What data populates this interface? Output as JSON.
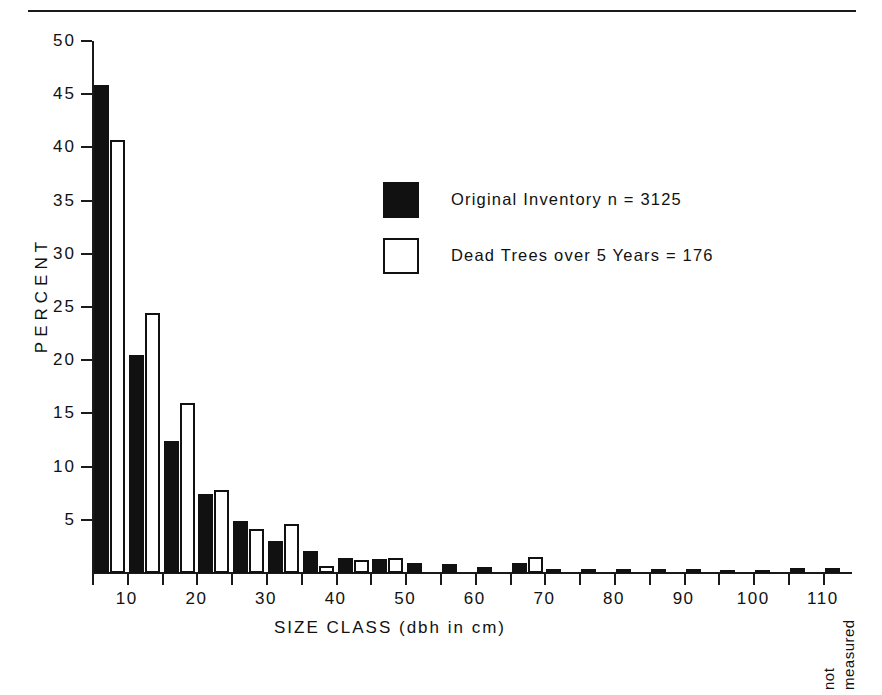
{
  "figure": {
    "top_rule": "horizontal-rule"
  },
  "axes": {
    "y_title": "PERCENT",
    "x_title": "SIZE CLASS  (dbh in cm)",
    "y_ticks": [
      "50",
      "45",
      "40",
      "35",
      "30",
      "25",
      "20",
      "15",
      "10",
      "5"
    ],
    "x_ticks": [
      "10",
      "20",
      "30",
      "40",
      "50",
      "60",
      "70",
      "80",
      "90",
      "100",
      "110"
    ],
    "not_measured_lines": [
      "not",
      "measured"
    ]
  },
  "legend": {
    "items": [
      {
        "style": "solid",
        "label": "Original Inventory  n =  3125"
      },
      {
        "style": "hollow",
        "label": "Dead Trees over 5 Years =  176"
      }
    ]
  },
  "colors": {
    "ink": "#111111",
    "paper": "#ffffff"
  },
  "chart_data": {
    "type": "bar",
    "title": "",
    "xlabel": "SIZE CLASS  (dbh in cm)",
    "ylabel": "PERCENT",
    "ylim": [
      0,
      50
    ],
    "yticks": [
      5,
      10,
      15,
      20,
      25,
      30,
      35,
      40,
      45,
      50
    ],
    "grid": false,
    "legend_position": "upper-center-right",
    "categories": [
      "10",
      "15",
      "20",
      "25",
      "30",
      "35",
      "40",
      "45",
      "50",
      "55",
      "60",
      "65",
      "70",
      "75",
      "80",
      "85",
      "90",
      "95",
      "100",
      "105",
      "110",
      "115",
      "not measured"
    ],
    "series": [
      {
        "name": "Original Inventory  n =  3125",
        "style": "solid",
        "values": [
          45.9,
          20.5,
          12.4,
          7.4,
          4.9,
          3.0,
          2.1,
          1.4,
          1.3,
          0.9,
          0.8,
          0.6,
          0.9,
          0.4,
          0.4,
          0.4,
          0.4,
          0.4,
          0.2,
          0.2,
          0.5,
          0.5,
          0.0
        ]
      },
      {
        "name": "Dead Trees over 5 Years =  176",
        "style": "hollow",
        "values": [
          40.7,
          24.4,
          16.0,
          7.8,
          4.1,
          4.6,
          0.7,
          1.2,
          1.4,
          0.0,
          0.0,
          0.0,
          1.5,
          0.0,
          0.0,
          0.0,
          0.0,
          0.0,
          0.0,
          0.0,
          0.0,
          0.0,
          0.0
        ]
      }
    ]
  }
}
